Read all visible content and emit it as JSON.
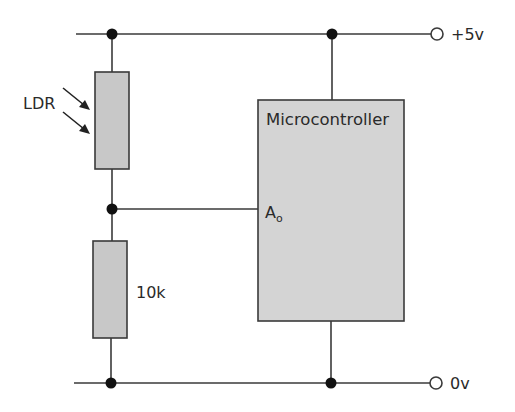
{
  "diagram": {
    "type": "circuit-schematic",
    "colors": {
      "wire": "#3a3a3a",
      "component_fill": "#c8c8c8",
      "microcontroller_fill": "#d4d4d4",
      "junction": "#111111",
      "background": "#ffffff"
    },
    "rails": {
      "top": {
        "label": "+5v"
      },
      "bottom": {
        "label": "0v"
      }
    },
    "components": {
      "ldr": {
        "label": "LDR",
        "kind": "light-dependent-resistor"
      },
      "resistor": {
        "label": "10k",
        "kind": "fixed-resistor"
      },
      "microcontroller": {
        "label": "Microcontroller",
        "pin_main": "A",
        "pin_sub": "o"
      }
    },
    "connections": [
      "+5v rail to LDR top",
      "LDR bottom to 10k top (divider midpoint)",
      "divider midpoint to Microcontroller pin Ao",
      "10k bottom to 0v rail",
      "+5v rail to Microcontroller top",
      "Microcontroller bottom to 0v rail"
    ]
  }
}
